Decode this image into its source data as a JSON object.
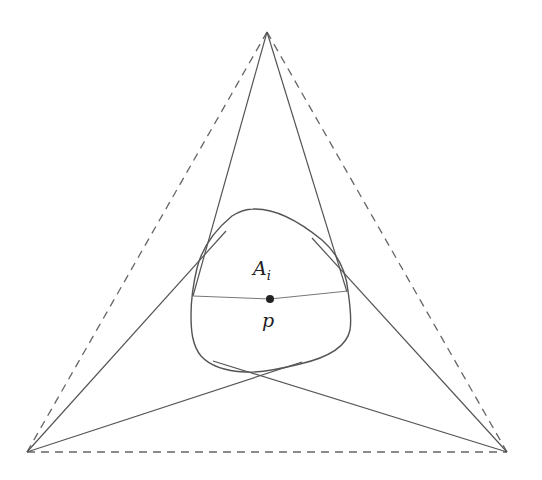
{
  "diagram": {
    "type": "geometric-figure",
    "colors": {
      "stroke": "#555555",
      "dashed": "#666666",
      "point": "#222222",
      "background": "#ffffff"
    },
    "outer_triangle": {
      "style": "dashed",
      "vertices": [
        {
          "name": "top",
          "x": 267,
          "y": 32
        },
        {
          "name": "bottom-left",
          "x": 27,
          "y": 452
        },
        {
          "name": "bottom-right",
          "x": 507,
          "y": 452
        }
      ]
    },
    "tangent_lines": [
      {
        "from": "top",
        "to_x": 193,
        "to_y": 296
      },
      {
        "from": "top",
        "to_x": 347,
        "to_y": 292
      },
      {
        "from": "bottom-left",
        "to_x": 226,
        "to_y": 231
      },
      {
        "from": "bottom-left",
        "to_x": 302,
        "to_y": 362
      },
      {
        "from": "bottom-right",
        "to_x": 312,
        "to_y": 238
      },
      {
        "from": "bottom-right",
        "to_x": 213,
        "to_y": 361
      }
    ],
    "region": {
      "label_main": "A",
      "label_sub": "i"
    },
    "point": {
      "label": "p",
      "x": 270,
      "y": 299
    },
    "chord": {
      "x1": 193,
      "y1": 296,
      "x2": 348,
      "y2": 291
    }
  }
}
